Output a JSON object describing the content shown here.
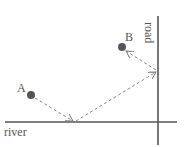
{
  "diagram": {
    "title": "",
    "labels": {
      "point_a": "A",
      "point_b": "B",
      "river": "river",
      "road": "road"
    },
    "colors": {
      "line": "#555555",
      "point": "#555555",
      "path": "#777777"
    },
    "points": {
      "A": [
        31,
        95
      ],
      "B": [
        122,
        47
      ],
      "river_touch": [
        74,
        122
      ],
      "road_touch": [
        157,
        71
      ]
    },
    "path_description": "Dashed path from A to the river, then to the road, then to B"
  }
}
